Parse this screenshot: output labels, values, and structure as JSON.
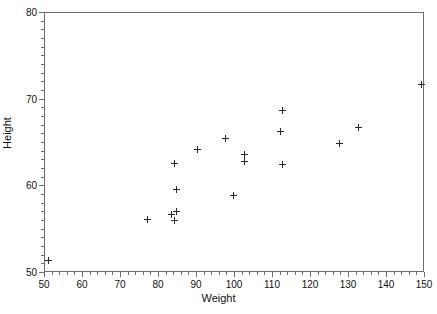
{
  "chart_data": {
    "type": "scatter",
    "title": "",
    "xlabel": "Weight",
    "ylabel": "Height",
    "xlim": [
      50,
      150
    ],
    "ylim": [
      50,
      80
    ],
    "xticks": [
      50,
      60,
      70,
      80,
      90,
      100,
      110,
      120,
      130,
      140,
      150
    ],
    "xticklabels": [
      "50",
      "60",
      "70",
      "80",
      "90",
      "100",
      "110",
      "120",
      "130",
      "140",
      "150"
    ],
    "yticks": [
      50,
      60,
      70,
      80
    ],
    "yticklabels": [
      "50",
      "60",
      "70",
      "80"
    ],
    "x_minor_interval": 2,
    "y_minor_interval": 1,
    "grid": false,
    "legend": null,
    "marker": "plus",
    "marker_color": "#2a2a2e",
    "frame_color": "#6e6e72",
    "background": "#ffffff",
    "points": [
      {
        "x": 50.8,
        "y": 51.5
      },
      {
        "x": 77.1,
        "y": 56.2
      },
      {
        "x": 83.2,
        "y": 56.8
      },
      {
        "x": 84.2,
        "y": 56.1
      },
      {
        "x": 84.7,
        "y": 57.1
      },
      {
        "x": 84.5,
        "y": 59.6
      },
      {
        "x": 84.2,
        "y": 62.6
      },
      {
        "x": 90.0,
        "y": 64.3
      },
      {
        "x": 97.6,
        "y": 65.5
      },
      {
        "x": 99.5,
        "y": 59.0
      },
      {
        "x": 102.6,
        "y": 63.7
      },
      {
        "x": 102.6,
        "y": 62.9
      },
      {
        "x": 112.4,
        "y": 68.8
      },
      {
        "x": 112.0,
        "y": 66.3
      },
      {
        "x": 112.6,
        "y": 62.5
      },
      {
        "x": 127.6,
        "y": 64.9
      },
      {
        "x": 132.6,
        "y": 66.8
      },
      {
        "x": 149.2,
        "y": 71.8
      }
    ]
  }
}
